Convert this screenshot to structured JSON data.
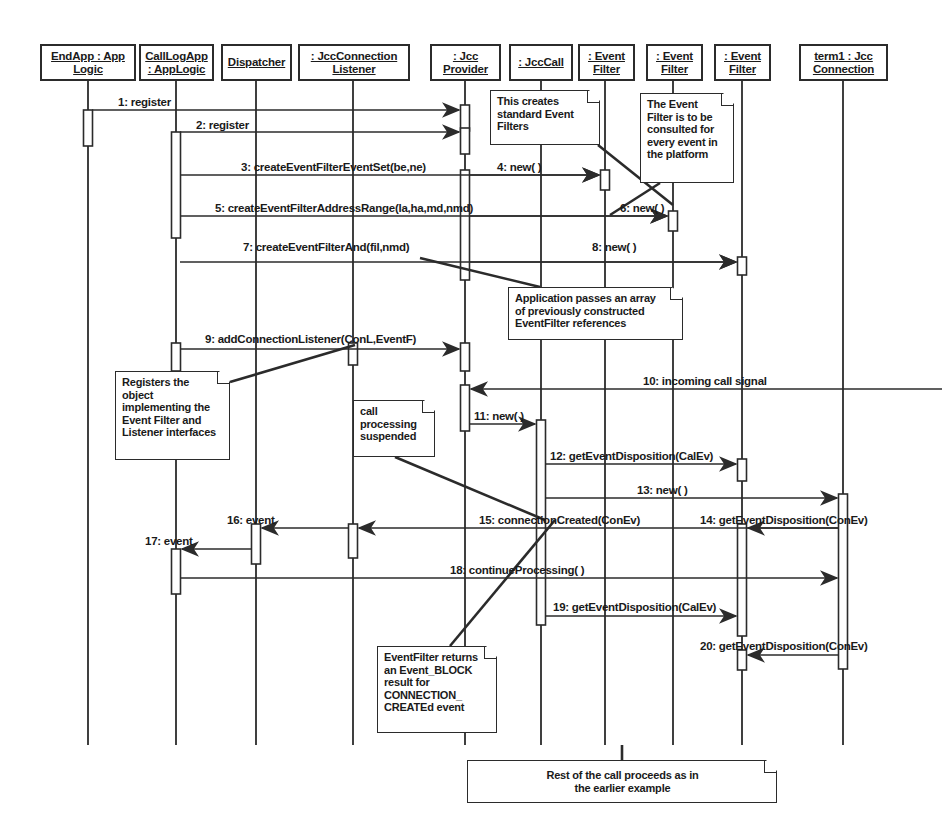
{
  "diagram": {
    "type": "uml-sequence-diagram",
    "background": "#ffffff",
    "line_color": "#2b2b2b"
  },
  "lifelines": [
    {
      "id": "endapp",
      "name": "EndApp : App Logic",
      "lines": [
        "EndApp : App",
        "Logic"
      ],
      "x": 88,
      "box": {
        "left": 40,
        "top": 44,
        "width": 96,
        "height": 37
      }
    },
    {
      "id": "calllogapp",
      "name": "CallLogApp : AppLogic",
      "lines": [
        "CallLogApp",
        ": AppLogic"
      ],
      "x": 176,
      "box": {
        "left": 139,
        "top": 44,
        "width": 75,
        "height": 37
      }
    },
    {
      "id": "dispatcher",
      "name": "Dispatcher",
      "lines": [
        "Dispatcher"
      ],
      "x": 256,
      "box": {
        "left": 221,
        "top": 44,
        "width": 71,
        "height": 37
      }
    },
    {
      "id": "jcclistener",
      "name": ": JccConnection Listener",
      "lines": [
        ": JccConnection",
        "Listener"
      ],
      "x": 353,
      "box": {
        "left": 298,
        "top": 44,
        "width": 112,
        "height": 37
      }
    },
    {
      "id": "jccprovider",
      "name": ": Jcc Provider",
      "lines": [
        ": Jcc",
        "Provider"
      ],
      "x": 465,
      "box": {
        "left": 430,
        "top": 44,
        "width": 71,
        "height": 37
      }
    },
    {
      "id": "jcccall",
      "name": ": JccCall",
      "lines": [
        ": JccCall"
      ],
      "x": 541,
      "box": {
        "left": 509,
        "top": 44,
        "width": 64,
        "height": 37
      }
    },
    {
      "id": "evfilter1",
      "name": ": Event Filter",
      "lines": [
        ": Event",
        "Filter"
      ],
      "x": 605,
      "box": {
        "left": 578,
        "top": 44,
        "width": 57,
        "height": 37
      }
    },
    {
      "id": "evfilter2",
      "name": ": Event Filter",
      "lines": [
        ": Event",
        "Filter"
      ],
      "x": 673,
      "box": {
        "left": 646,
        "top": 44,
        "width": 57,
        "height": 37
      }
    },
    {
      "id": "evfilter3",
      "name": ": Event Filter",
      "lines": [
        ": Event",
        "Filter"
      ],
      "x": 742,
      "box": {
        "left": 714,
        "top": 44,
        "width": 57,
        "height": 37
      }
    },
    {
      "id": "term1",
      "name": "term1 : Jcc Connection",
      "lines": [
        "term1 : Jcc",
        "Connection"
      ],
      "x": 843,
      "box": {
        "left": 799,
        "top": 44,
        "width": 89,
        "height": 37
      }
    }
  ],
  "messages": [
    {
      "num": "1",
      "label": "1: register",
      "from": "endapp",
      "to": "jccprovider",
      "y": 110,
      "label_x": 118,
      "label_y": 96,
      "arrow_dir": "right"
    },
    {
      "num": "2",
      "label": "2: register",
      "from": "calllogapp",
      "to": "jccprovider",
      "y": 132,
      "label_x": 196,
      "label_y": 119,
      "arrow_dir": "right"
    },
    {
      "num": "3",
      "label": "3: createEventFilterEventSet(be,ne)",
      "from": "calllogapp",
      "to": "evfilter1",
      "y": 175,
      "label_x": 241,
      "label_y": 161,
      "arrow_dir": "right"
    },
    {
      "num": "4",
      "label": "4: new( )",
      "from": "jccprovider",
      "to": "evfilter1",
      "y": 175,
      "label_x": 497,
      "label_y": 161,
      "arrow_dir": "right"
    },
    {
      "num": "5",
      "label": "5: createEventFilterAddressRange(la,ha,md,nmd)",
      "from": "calllogapp",
      "to": "evfilter2",
      "y": 216,
      "label_x": 215,
      "label_y": 202,
      "arrow_dir": "right"
    },
    {
      "num": "6",
      "label": "6: new( )",
      "from": "jccprovider",
      "to": "evfilter2",
      "y": 216,
      "label_x": 620,
      "label_y": 202,
      "arrow_dir": "right"
    },
    {
      "num": "7",
      "label": "7: createEventFilterAnd(fil,nmd)",
      "from": "calllogapp",
      "to": "evfilter3",
      "y": 262,
      "label_x": 243,
      "label_y": 241,
      "arrow_dir": "right"
    },
    {
      "num": "8",
      "label": "8: new( )",
      "from": "jccprovider",
      "to": "evfilter3",
      "y": 262,
      "label_x": 592,
      "label_y": 241,
      "arrow_dir": "right"
    },
    {
      "num": "9",
      "label": "9: addConnectionListener(ConL,EventF)",
      "from": "calllogapp",
      "to": "jccprovider",
      "y": 349,
      "label_x": 205,
      "label_y": 333,
      "arrow_dir": "right"
    },
    {
      "num": "10",
      "label": "10: incoming call signal",
      "from": "right-edge",
      "to": "jccprovider",
      "y": 389,
      "label_x": 643,
      "label_y": 375,
      "arrow_dir": "left"
    },
    {
      "num": "11",
      "label": "11: new( )",
      "from": "jccprovider",
      "to": "jcccall",
      "y": 424,
      "label_x": 474,
      "label_y": 410,
      "arrow_dir": "right"
    },
    {
      "num": "12",
      "label": "12: getEventDisposition(CalEv)",
      "from": "jcccall",
      "to": "evfilter3",
      "y": 464,
      "label_x": 550,
      "label_y": 450,
      "arrow_dir": "right"
    },
    {
      "num": "13",
      "label": "13: new( )",
      "from": "jcccall",
      "to": "term1",
      "y": 498,
      "label_x": 637,
      "label_y": 484,
      "arrow_dir": "right"
    },
    {
      "num": "14",
      "label": "14: getEventDisposition(ConEv)",
      "from": "term1",
      "to": "evfilter3",
      "y": 528,
      "label_x": 700,
      "label_y": 514,
      "arrow_dir": "left"
    },
    {
      "num": "15",
      "label": "15: connectionCreated(ConEv)",
      "from": "term1",
      "to": "jcclistener",
      "y": 528,
      "label_x": 479,
      "label_y": 514,
      "arrow_dir": "left"
    },
    {
      "num": "16",
      "label": "16: event",
      "from": "jcclistener",
      "to": "dispatcher",
      "y": 528,
      "label_x": 227,
      "label_y": 514,
      "arrow_dir": "left"
    },
    {
      "num": "17",
      "label": "17: event",
      "from": "dispatcher",
      "to": "calllogapp",
      "y": 549,
      "label_x": 145,
      "label_y": 535,
      "arrow_dir": "left"
    },
    {
      "num": "18",
      "label": "18: continueProcessing( )",
      "from": "calllogapp",
      "to": "term1",
      "y": 578,
      "label_x": 450,
      "label_y": 564,
      "arrow_dir": "right"
    },
    {
      "num": "19",
      "label": "19: getEventDisposition(CalEv)",
      "from": "jcccall",
      "to": "evfilter3",
      "y": 616,
      "label_x": 553,
      "label_y": 601,
      "arrow_dir": "right"
    },
    {
      "num": "20",
      "label": "20: getEventDisposition(ConEv)",
      "from": "term1",
      "to": "evfilter3",
      "y": 655,
      "label_x": 700,
      "label_y": 640,
      "arrow_dir": "left"
    }
  ],
  "notes": [
    {
      "id": "note-standard-filters",
      "text": "This creates standard Event Filters",
      "lines": [
        "This creates",
        "standard Event",
        "Filters"
      ],
      "left": 490,
      "top": 90,
      "width": 110,
      "height": 55,
      "anchor_to": "evfilter1"
    },
    {
      "id": "note-consulted-every-event",
      "text": "The Event Filter is to be consulted for every event in the platform",
      "lines": [
        "The Event",
        "Filter is to be",
        "consulted for",
        "every event in",
        "the platform"
      ],
      "left": 640,
      "top": 93,
      "width": 94,
      "height": 90,
      "anchor_to": "evfilter2"
    },
    {
      "id": "note-array-of-references",
      "text": "Application passes an array of previously constructed EventFilter references",
      "lines": [
        "Application passes an array",
        "of previously constructed",
        "EventFilter references"
      ],
      "left": 508,
      "top": 287,
      "width": 175,
      "height": 53,
      "anchor_to": "msg-7"
    },
    {
      "id": "note-registers-object",
      "text": "Registers the object implementing the Event Filter and Listener interfaces",
      "lines": [
        "Registers the",
        "object",
        "implementing the",
        "Event Filter and",
        "Listener interfaces"
      ],
      "left": 115,
      "top": 371,
      "width": 115,
      "height": 89,
      "anchor_to": "msg-9"
    },
    {
      "id": "note-call-processing-suspended",
      "text": "call processing suspended",
      "lines": [
        "call",
        "processing",
        "suspended"
      ],
      "left": 353,
      "top": 400,
      "width": 82,
      "height": 57,
      "anchor_to": "msg-18"
    },
    {
      "id": "note-eventfilter-returns-block",
      "text": "EventFilter returns an Event_BLOCK result for CONNECTION_CREATEd event",
      "lines": [
        "EventFilter returns",
        "an Event_BLOCK",
        "result for",
        "CONNECTION_",
        "CREATEd event"
      ],
      "left": 377,
      "top": 646,
      "width": 120,
      "height": 87,
      "anchor_to": "msg-15"
    },
    {
      "id": "note-rest-of-call",
      "text": "Rest of the call proceeds as in the earlier example",
      "lines": [
        "Rest of the call proceeds as in",
        "the earlier example"
      ],
      "left": 467,
      "top": 760,
      "width": 310,
      "height": 43,
      "anchor_to": "none",
      "centered": true
    }
  ],
  "activations": [
    {
      "lifeline": "endapp",
      "top": 110,
      "height": 36,
      "width": 9
    },
    {
      "lifeline": "calllogapp",
      "top": 132,
      "height": 106,
      "width": 9
    },
    {
      "lifeline": "calllogapp",
      "top": 343,
      "height": 28,
      "width": 9
    },
    {
      "lifeline": "calllogapp",
      "top": 549,
      "height": 45,
      "width": 9
    },
    {
      "lifeline": "dispatcher",
      "top": 524,
      "height": 40,
      "width": 9
    },
    {
      "lifeline": "jcclistener",
      "top": 343,
      "height": 22,
      "width": 9
    },
    {
      "lifeline": "jcclistener",
      "top": 524,
      "height": 34,
      "width": 9
    },
    {
      "lifeline": "jccprovider",
      "top": 105,
      "height": 26,
      "width": 9
    },
    {
      "lifeline": "jccprovider",
      "top": 128,
      "height": 26,
      "width": 9
    },
    {
      "lifeline": "jccprovider",
      "top": 170,
      "height": 110,
      "width": 9
    },
    {
      "lifeline": "jccprovider",
      "top": 343,
      "height": 28,
      "width": 9
    },
    {
      "lifeline": "jccprovider",
      "top": 385,
      "height": 46,
      "width": 9
    },
    {
      "lifeline": "jcccall",
      "top": 420,
      "height": 205,
      "width": 9
    },
    {
      "lifeline": "evfilter1",
      "top": 170,
      "height": 20,
      "width": 9
    },
    {
      "lifeline": "evfilter2",
      "top": 211,
      "height": 20,
      "width": 9
    },
    {
      "lifeline": "evfilter3",
      "top": 257,
      "height": 18,
      "width": 9
    },
    {
      "lifeline": "evfilter3",
      "top": 459,
      "height": 22,
      "width": 9
    },
    {
      "lifeline": "evfilter3",
      "top": 524,
      "height": 112,
      "width": 9
    },
    {
      "lifeline": "evfilter3",
      "top": 650,
      "height": 20,
      "width": 9
    },
    {
      "lifeline": "term1",
      "top": 494,
      "height": 175,
      "width": 9
    }
  ],
  "caption": {
    "text": ""
  }
}
